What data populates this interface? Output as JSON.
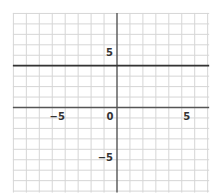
{
  "chart_data": {
    "type": "line",
    "title": "",
    "xlabel": "",
    "ylabel": "",
    "xlim": [
      -8,
      7
    ],
    "ylim": [
      -8,
      9
    ],
    "grid": true,
    "grid_step": 1,
    "x_tick_labels": [
      {
        "value": -5,
        "label": "−5"
      },
      {
        "value": 0,
        "label": "0"
      },
      {
        "value": 5,
        "label": "5"
      }
    ],
    "y_tick_labels": [
      {
        "value": 5,
        "label": "5"
      },
      {
        "value": -5,
        "label": "−5"
      }
    ],
    "series": [
      {
        "name": "y = 4",
        "equation": "y = 4",
        "x": [
          -8,
          7
        ],
        "y": [
          4,
          4
        ]
      }
    ],
    "legend": null
  },
  "colors": {
    "grid": "#d6d6d6",
    "axis": "#555555",
    "line": "#333333",
    "background": "#ffffff"
  }
}
